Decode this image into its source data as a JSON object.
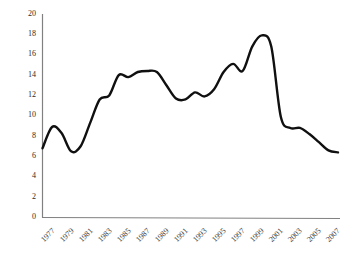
{
  "chart_data": {
    "type": "line",
    "title": "",
    "subtitle": "",
    "xlabel": "",
    "ylabel": "",
    "grid": false,
    "legend": "none",
    "line_color": "#101010",
    "axis_color": "#808080",
    "ylim": [
      0,
      20
    ],
    "yticks": [
      0,
      2,
      4,
      6,
      8,
      10,
      12,
      14,
      16,
      18,
      20
    ],
    "ytick_labels": [
      "0",
      "2",
      "4",
      "6",
      "8",
      "10",
      "12",
      "14",
      "16",
      "18",
      "20"
    ],
    "xlim": [
      1977,
      2008
    ],
    "xticks": [
      1977,
      1979,
      1981,
      1983,
      1985,
      1987,
      1989,
      1991,
      1993,
      1995,
      1997,
      1999,
      2001,
      2003,
      2005,
      2007
    ],
    "xtick_labels": [
      "1977",
      "1979",
      "1981",
      "1983",
      "1985",
      "1987",
      "1989",
      "1991",
      "1993",
      "1995",
      "1997",
      "1999",
      "2001",
      "2003",
      "2005",
      "2007"
    ],
    "x": [
      1977,
      1978,
      1979,
      1980,
      1981,
      1982,
      1983,
      1984,
      1985,
      1986,
      1987,
      1988,
      1989,
      1990,
      1991,
      1992,
      1993,
      1994,
      1995,
      1996,
      1997,
      1998,
      1999,
      2000,
      2001,
      2002,
      2003,
      2004,
      2005,
      2006,
      2007,
      2008
    ],
    "values": [
      6.8,
      8.9,
      8.3,
      6.5,
      7.0,
      9.3,
      11.6,
      12.0,
      14.0,
      13.8,
      14.3,
      14.4,
      14.3,
      13.0,
      11.7,
      11.6,
      12.3,
      11.9,
      12.6,
      14.3,
      15.1,
      14.4,
      16.8,
      17.9,
      16.8,
      9.9,
      8.8,
      8.8,
      8.2,
      7.4,
      6.6,
      6.4
    ]
  }
}
